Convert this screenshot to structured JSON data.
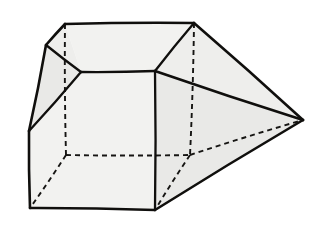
{
  "figure": {
    "canvas": {
      "width": 328,
      "height": 234
    },
    "colors": {
      "background": "#ffffff",
      "paper": "#f3f3f1",
      "face_light": "#f2f2f0",
      "face_mid": "#eeeeec",
      "face_shadow": "#e9e9e7",
      "edge_visible": "#100f0d",
      "edge_hidden": "#161513"
    },
    "stroke_widths": {
      "edge_visible": 2.6,
      "edge_inner": 2.3,
      "edge_hidden": 1.9
    },
    "hidden_edge_dash": "5,4",
    "vertices": {
      "top_front_left": [
        65,
        24
      ],
      "top_front_right": [
        194,
        23
      ],
      "top_left_outer": [
        46,
        45
      ],
      "left_mid": [
        29,
        131
      ],
      "bottom_left": [
        30,
        208
      ],
      "inner_left": [
        81,
        72
      ],
      "inner_right": [
        155,
        71
      ],
      "inner_bottom": [
        155,
        210
      ],
      "hidden_left": [
        66,
        155
      ],
      "hidden_right": [
        190,
        155
      ],
      "apex_right": [
        303,
        120
      ]
    },
    "visible_edges": [
      {
        "name": "top-ridge",
        "from": "top_front_left",
        "to": "top_front_right"
      },
      {
        "name": "top-left-slope",
        "from": "top_front_left",
        "to": "top_left_outer"
      },
      {
        "name": "left-upper-edge",
        "from": "top_left_outer",
        "to": "left_mid"
      },
      {
        "name": "left-lower-edge",
        "from": "left_mid",
        "to": "bottom_left"
      },
      {
        "name": "bottom-front-edge",
        "from": "bottom_left",
        "to": "inner_bottom"
      },
      {
        "name": "bevel-upper-left",
        "from": "top_left_outer",
        "to": "inner_left"
      },
      {
        "name": "bevel-lower-left",
        "from": "inner_left",
        "to": "left_mid"
      },
      {
        "name": "inner-top-horizontal",
        "from": "inner_left",
        "to": "inner_right"
      },
      {
        "name": "inner-vertical",
        "from": "inner_right",
        "to": "inner_bottom"
      },
      {
        "name": "bevel-upper-right",
        "from": "top_front_right",
        "to": "inner_right"
      },
      {
        "name": "apex-upper-edge",
        "from": "top_front_right",
        "to": "apex_right"
      },
      {
        "name": "apex-middle-edge",
        "from": "inner_right",
        "to": "apex_right"
      },
      {
        "name": "apex-lower-edge",
        "from": "inner_bottom",
        "to": "apex_right"
      }
    ],
    "hidden_edges": [
      {
        "name": "hidden-vertical-left",
        "from": "top_front_left",
        "to": "hidden_left"
      },
      {
        "name": "hidden-vertical-right",
        "from": "top_front_right",
        "to": "hidden_right"
      },
      {
        "name": "hidden-back-horizontal",
        "from": "hidden_left",
        "to": "hidden_right"
      },
      {
        "name": "hidden-diagonal-left",
        "from": "hidden_left",
        "to": "bottom_left"
      },
      {
        "name": "hidden-diagonal-right",
        "from": "hidden_right",
        "to": "inner_bottom"
      },
      {
        "name": "hidden-apex-edge",
        "from": "hidden_right",
        "to": "apex_right"
      }
    ],
    "faces": [
      {
        "name": "top-face",
        "shade": "face_light",
        "points": "65,24 194,23 155,71 81,72"
      },
      {
        "name": "left-bevel-face",
        "shade": "face_mid",
        "points": "65,24 81,72 29,131 46,45"
      },
      {
        "name": "left-side-face",
        "shade": "face_shadow",
        "points": "46,45 29,131 30,208 155,210 155,71 81,72"
      },
      {
        "name": "front-face",
        "shade": "face_light",
        "points": "81,72 155,71 155,210 30,208 29,131"
      },
      {
        "name": "right-upper-face",
        "shade": "face_mid",
        "points": "194,23 303,120 155,71"
      },
      {
        "name": "right-lower-face",
        "shade": "face_shadow",
        "points": "155,71 303,120 155,210"
      }
    ]
  }
}
